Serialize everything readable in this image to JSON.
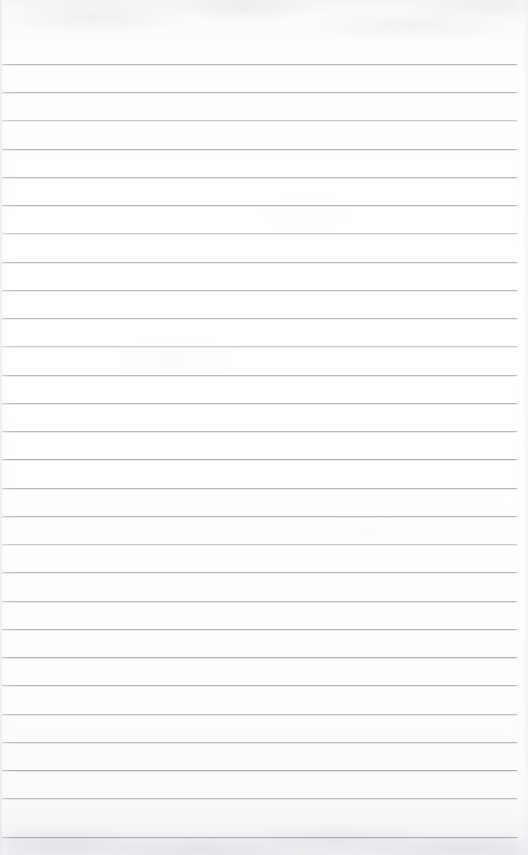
{
  "page": {
    "kind": "scanned-lined-paper",
    "width_px": 528,
    "height_px": 855,
    "content_text": "",
    "has_handwriting": false,
    "has_printed_text": false,
    "has_margin_rule": false,
    "has_holes": false
  },
  "paper": {
    "background_color": "#fdfdfe",
    "top_band_color": "#f2f2f5",
    "bottom_band_color": "#eeeef1",
    "edge_shadow_color": "#e2e3e8",
    "texture": "faint mottled scan grain along top and bottom edges"
  },
  "ruling": {
    "line_color": "#b4b5ba",
    "line_color_soft": "#bdbec3",
    "line_color_strong": "#aaabb1",
    "line_thickness_px": 1,
    "spacing_px": 28.2,
    "first_line_y_px": 64,
    "last_line_y_px": 837,
    "line_start_x_px": 2,
    "line_end_x_px": 517,
    "line_count": 28,
    "top_margin_px": 64,
    "lines": [
      {
        "index": 1,
        "y": 64,
        "weight": "normal"
      },
      {
        "index": 2,
        "y": 92,
        "weight": "normal"
      },
      {
        "index": 3,
        "y": 120,
        "weight": "soft"
      },
      {
        "index": 4,
        "y": 149,
        "weight": "normal"
      },
      {
        "index": 5,
        "y": 177,
        "weight": "normal"
      },
      {
        "index": 6,
        "y": 205,
        "weight": "normal"
      },
      {
        "index": 7,
        "y": 233,
        "weight": "soft"
      },
      {
        "index": 8,
        "y": 262,
        "weight": "normal"
      },
      {
        "index": 9,
        "y": 290,
        "weight": "normal"
      },
      {
        "index": 10,
        "y": 318,
        "weight": "normal"
      },
      {
        "index": 11,
        "y": 346,
        "weight": "soft"
      },
      {
        "index": 12,
        "y": 375,
        "weight": "normal"
      },
      {
        "index": 13,
        "y": 403,
        "weight": "normal"
      },
      {
        "index": 14,
        "y": 431,
        "weight": "normal"
      },
      {
        "index": 15,
        "y": 459,
        "weight": "strong"
      },
      {
        "index": 16,
        "y": 488,
        "weight": "normal"
      },
      {
        "index": 17,
        "y": 516,
        "weight": "normal"
      },
      {
        "index": 18,
        "y": 544,
        "weight": "soft"
      },
      {
        "index": 19,
        "y": 572,
        "weight": "normal"
      },
      {
        "index": 20,
        "y": 601,
        "weight": "normal"
      },
      {
        "index": 21,
        "y": 629,
        "weight": "normal"
      },
      {
        "index": 22,
        "y": 657,
        "weight": "strong"
      },
      {
        "index": 23,
        "y": 685,
        "weight": "normal"
      },
      {
        "index": 24,
        "y": 714,
        "weight": "normal"
      },
      {
        "index": 25,
        "y": 742,
        "weight": "normal"
      },
      {
        "index": 26,
        "y": 770,
        "weight": "strong"
      },
      {
        "index": 27,
        "y": 798,
        "weight": "normal"
      },
      {
        "index": 28,
        "y": 837,
        "weight": "strong"
      }
    ]
  }
}
